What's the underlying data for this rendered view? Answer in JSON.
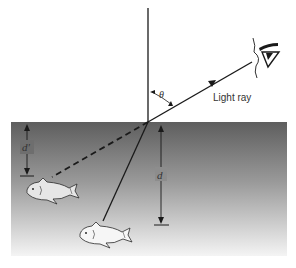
{
  "diagram": {
    "labels": {
      "theta": "θ",
      "light_ray": "Light ray",
      "apparent_depth": "d'",
      "real_depth": "d"
    },
    "elements": {
      "normal_line": "vertical normal to surface",
      "refracted_ray": "light ray in air toward eye",
      "ray_in_water": "solid ray from real fish",
      "virtual_ray": "dashed extension to apparent fish",
      "real_fish": "real fish position",
      "apparent_fish": "apparent (virtual) fish image",
      "observer_eye": "observer eye"
    },
    "colors": {
      "water_top": "#5e5e5e",
      "water_bottom": "#f2f2f2",
      "line": "#1a1a1a",
      "background": "#ffffff"
    }
  }
}
